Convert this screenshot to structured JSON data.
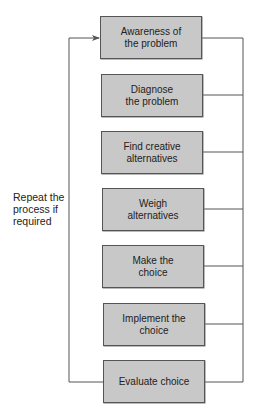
{
  "diagram": {
    "type": "process-flow",
    "colors": {
      "box_fill": "#c8c8c8",
      "box_border": "#555555",
      "line": "#555555",
      "text": "#222222",
      "background": "#ffffff"
    },
    "steps": [
      {
        "label": "Awareness of\nthe problem"
      },
      {
        "label": "Diagnose\nthe problem"
      },
      {
        "label": "Find creative\nalternatives"
      },
      {
        "label": "Weigh\nalternatives"
      },
      {
        "label": "Make the\nchoice"
      },
      {
        "label": "Implement the\nchoice"
      },
      {
        "label": "Evaluate choice"
      }
    ],
    "feedback_loop": {
      "label": "Repeat the\nprocess if\nrequired",
      "from": "Evaluate choice",
      "to": "Awareness of the problem"
    },
    "right_bus": {
      "description": "Every step connects to a shared vertical line on the right"
    }
  }
}
